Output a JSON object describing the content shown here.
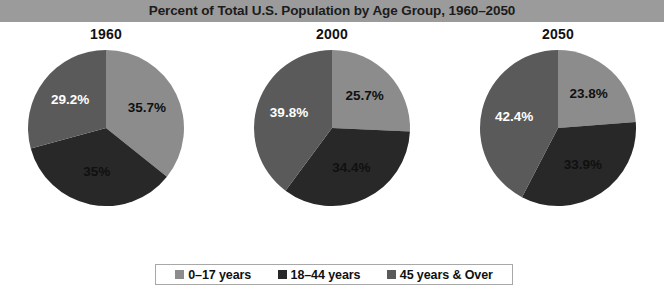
{
  "title": "Percent of Total U.S. Population by Age Group, 1960–2050",
  "colors": {
    "band": "#9b9b9b",
    "age_0_17": "#8c8c8c",
    "age_18_44": "#282828",
    "age_45_over": "#5a5a5a",
    "background": "#ffffff",
    "legend_border": "#a8a8a8",
    "title_text": "#1c1c1c"
  },
  "legend": {
    "items": [
      {
        "label": "0–17 years",
        "color": "#8c8c8c"
      },
      {
        "label": "18–44 years",
        "color": "#282828"
      },
      {
        "label": "45 years & Over",
        "color": "#5a5a5a"
      }
    ]
  },
  "chart_data": {
    "type": "pie",
    "title": "Percent of Total U.S. Population by Age Group, 1960–2050",
    "xlabel": "",
    "ylabel": "",
    "legend_position": "bottom",
    "grid": false,
    "categories": [
      "0–17 years",
      "18–44 years",
      "45 years & Over"
    ],
    "charts": [
      {
        "title": "1960",
        "slices": [
          {
            "name": "0–17 years",
            "value": 35.7,
            "label": "35.7%",
            "color": "#8c8c8c",
            "label_color": "dark"
          },
          {
            "name": "18–44 years",
            "value": 35,
            "label": "35%",
            "color": "#282828",
            "label_color": "dark"
          },
          {
            "name": "45 years & Over",
            "value": 29.2,
            "label": "29.2%",
            "color": "#5a5a5a",
            "label_color": "light"
          }
        ]
      },
      {
        "title": "2000",
        "slices": [
          {
            "name": "0–17 years",
            "value": 25.7,
            "label": "25.7%",
            "color": "#8c8c8c",
            "label_color": "dark"
          },
          {
            "name": "18–44 years",
            "value": 34.4,
            "label": "34.4%",
            "color": "#282828",
            "label_color": "dark"
          },
          {
            "name": "45 years & Over",
            "value": 39.8,
            "label": "39.8%",
            "color": "#5a5a5a",
            "label_color": "light"
          }
        ]
      },
      {
        "title": "2050",
        "slices": [
          {
            "name": "0–17 years",
            "value": 23.8,
            "label": "23.8%",
            "color": "#8c8c8c",
            "label_color": "dark"
          },
          {
            "name": "18–44 years",
            "value": 33.9,
            "label": "33.9%",
            "color": "#282828",
            "label_color": "dark"
          },
          {
            "name": "45 years & Over",
            "value": 42.4,
            "label": "42.4%",
            "color": "#5a5a5a",
            "label_color": "light"
          }
        ]
      }
    ]
  }
}
